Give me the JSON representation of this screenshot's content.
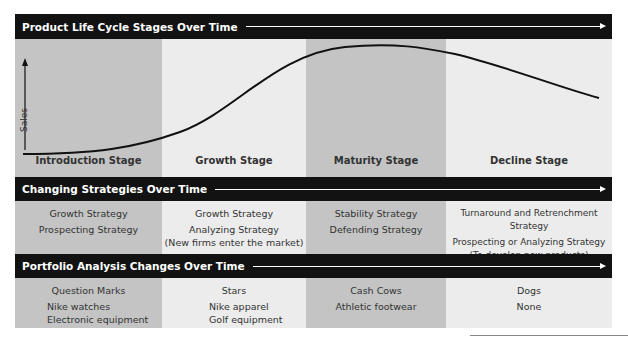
{
  "headers": {
    "lifecycle": "Product Life Cycle Stages Over Time",
    "strategies": "Changing Strategies Over Time",
    "portfolio": "Portfolio Analysis Changes Over Time"
  },
  "axis": {
    "y_label": "Sales"
  },
  "stages": [
    {
      "label": "Introduction Stage"
    },
    {
      "label": "Growth Stage"
    },
    {
      "label": "Maturity Stage"
    },
    {
      "label": "Decline Stage"
    }
  ],
  "strategies": [
    {
      "line1": "Growth Strategy",
      "line2": "Prospecting Strategy",
      "line3": ""
    },
    {
      "line1": "Growth Strategy",
      "line2": "Analyzing Strategy",
      "line3": "(New firms enter the market)"
    },
    {
      "line1": "Stability Strategy",
      "line2": "Defending Strategy",
      "line3": ""
    },
    {
      "line1": "Turnaround and Retrenchment Strategy",
      "line2": "Prospecting or Analyzing Strategy",
      "line3": "(To develop new products)"
    }
  ],
  "portfolio": [
    {
      "category": "Question Marks",
      "items": [
        "Nike watches",
        "Electronic equipment"
      ]
    },
    {
      "category": "Stars",
      "items": [
        "Nike apparel",
        "Golf equipment"
      ]
    },
    {
      "category": "Cash Cows",
      "items": [
        "Athletic footwear",
        ""
      ]
    },
    {
      "category": "Dogs",
      "items": [
        "None",
        ""
      ]
    }
  ],
  "colors": {
    "header_bg": "#121212",
    "dark_col": "#c4c4c4",
    "light_col": "#ececec",
    "curve": "#111111"
  }
}
